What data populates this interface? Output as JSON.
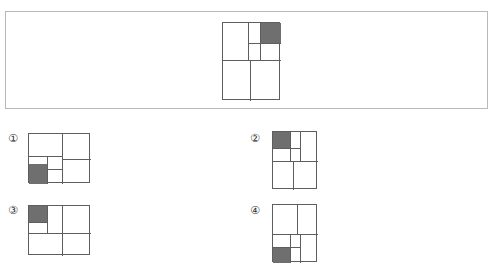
{
  "page": {
    "type": "spatial-reasoning-multiple-choice",
    "background_color": "#ffffff"
  },
  "colors": {
    "panel_border": "#b9b9b9",
    "figure_stroke": "#5e5e5e",
    "shaded_cell": "#706f6f",
    "label_text": "#33302f"
  },
  "question": {
    "panel_border_color": "#b9b9b9",
    "figure": {
      "name": "question-figure",
      "orientation": "portrait",
      "shaded_cell_position": "top-right",
      "description": "Portrait rectangle; upper half has a tall left cell and a right portion split into two stacked sub-cells plus a narrow column; the top-right cell is shaded. Lower half is divided into two cells by a vertical line."
    }
  },
  "options": [
    {
      "id": "1",
      "label": "①",
      "orientation": "landscape",
      "shaded_cell_position": "bottom-left",
      "description": "Landscape rectangle; left region subdivided into smaller cells with the bottom-left cell shaded."
    },
    {
      "id": "2",
      "label": "②",
      "orientation": "portrait",
      "shaded_cell_position": "top-left",
      "description": "Portrait rectangle mirroring the question figure; the top-left cell is shaded."
    },
    {
      "id": "3",
      "label": "③",
      "orientation": "landscape",
      "shaded_cell_position": "top-left",
      "description": "Landscape rectangle; the top-left cell is shaded."
    },
    {
      "id": "4",
      "label": "④",
      "orientation": "portrait",
      "shaded_cell_position": "bottom-left",
      "description": "Portrait rectangle; the bottom-left cell is shaded."
    }
  ]
}
